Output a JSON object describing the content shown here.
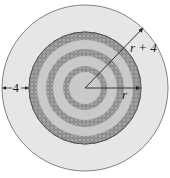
{
  "diagram": {
    "labels": {
      "outer_width": "4",
      "outer_radius": "r + 4",
      "inner_radius": "r"
    },
    "colors": {
      "outer_fill": "#e6e6e6",
      "inner_fill": "#c9c9c9",
      "ring_fill": "#9a9a9a",
      "stroke": "#555555"
    },
    "geometry": {
      "center": [
        85,
        88
      ],
      "outer_radius_px": 83,
      "inner_radius_px": 56,
      "rings_px": [
        {
          "outer": 56,
          "inner": 48
        },
        {
          "outer": 39,
          "inner": 32
        },
        {
          "outer": 22,
          "inner": 16
        }
      ]
    }
  }
}
